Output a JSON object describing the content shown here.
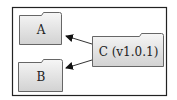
{
  "diagram": {
    "type": "dependency-graph",
    "nodes": [
      {
        "id": "A",
        "label": "A",
        "shape": "folder"
      },
      {
        "id": "B",
        "label": "B",
        "shape": "folder"
      },
      {
        "id": "C",
        "label": "C (v1.0.1)",
        "shape": "folder"
      }
    ],
    "edges": [
      {
        "from": "C",
        "to": "A"
      },
      {
        "from": "C",
        "to": "B"
      }
    ],
    "colors": {
      "fill_top": "#f4f4f4",
      "fill_bottom": "#d4d4d4",
      "stroke": "#555555",
      "frame": "#222222"
    }
  }
}
